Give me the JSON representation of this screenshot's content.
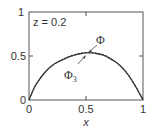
{
  "chart_data": {
    "type": "line",
    "title": "",
    "annotation_box": "z = 0.2",
    "xlabel": "x",
    "ylabel": "",
    "xlim": [
      0,
      1
    ],
    "ylim": [
      0,
      1
    ],
    "xticks": [
      0,
      0.5,
      1
    ],
    "xtick_labels": [
      "0",
      "0.5",
      "1"
    ],
    "yticks": [
      0,
      0.5,
      1
    ],
    "ytick_labels": [
      "0",
      "0.5",
      "1"
    ],
    "grid": false,
    "legend": "none (curves labeled with arrows)",
    "x": [
      0,
      0.05,
      0.1,
      0.15,
      0.2,
      0.25,
      0.3,
      0.35,
      0.4,
      0.45,
      0.5,
      0.55,
      0.6,
      0.65,
      0.7,
      0.75,
      0.8,
      0.85,
      0.9,
      0.95,
      1.0
    ],
    "series": [
      {
        "name": "Φ",
        "style": "solid",
        "values": [
          0,
          0.15,
          0.25,
          0.33,
          0.39,
          0.43,
          0.46,
          0.49,
          0.51,
          0.525,
          0.535,
          0.535,
          0.525,
          0.51,
          0.48,
          0.44,
          0.39,
          0.32,
          0.23,
          0.12,
          0
        ]
      },
      {
        "name": "Φ3",
        "style": "dashed",
        "values": [
          0,
          0.145,
          0.245,
          0.325,
          0.385,
          0.43,
          0.465,
          0.495,
          0.515,
          0.53,
          0.54,
          0.54,
          0.53,
          0.515,
          0.485,
          0.445,
          0.39,
          0.32,
          0.23,
          0.12,
          0
        ]
      }
    ],
    "annotations": [
      {
        "text": "Φ",
        "subscript": "",
        "arrow_to": [
          0.52,
          0.545
        ]
      },
      {
        "text": "Φ",
        "subscript": "3",
        "arrow_to": [
          0.49,
          0.53
        ]
      }
    ]
  },
  "labels": {
    "z_note": "z = 0.2",
    "xlabel": "x",
    "x0": "0",
    "x05": "0.5",
    "x1": "1",
    "y0": "0",
    "y05": "0.5",
    "y1": "1",
    "phi": "Φ",
    "phi3": "Φ",
    "phi3_sub": "3"
  }
}
